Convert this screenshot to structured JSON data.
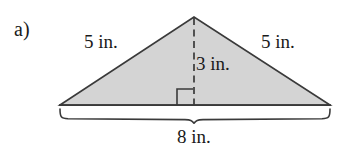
{
  "figure": {
    "part_label": "a)",
    "shape": "isosceles-triangle",
    "fill_color": "#d4d4d4",
    "stroke_color": "#3a3a3a",
    "background_color": "#ffffff",
    "vertices": {
      "apex": [
        194,
        17
      ],
      "base_left": [
        60,
        105
      ],
      "base_right": [
        330,
        105
      ]
    },
    "altitude": {
      "style": "dashed",
      "from": [
        194,
        17
      ],
      "to": [
        194,
        105
      ],
      "right_angle_marker": true
    },
    "brace": {
      "from_x": 60,
      "to_x": 330,
      "top_y": 108,
      "tip": [
        194,
        123
      ]
    }
  },
  "labels": {
    "left_leg": "5 in.",
    "right_leg": "5 in.",
    "height": "3 in.",
    "base": "8 in."
  }
}
